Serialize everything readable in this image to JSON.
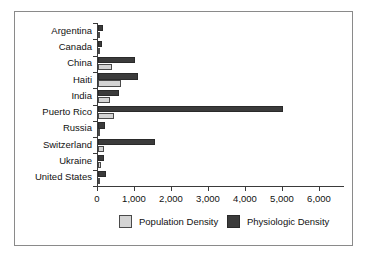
{
  "chart_data": {
    "type": "bar",
    "orientation": "horizontal",
    "title": "",
    "xlabel": "",
    "ylabel": "",
    "categories": [
      "Argentina",
      "Canada",
      "China",
      "Haiti",
      "India",
      "Puerto Rico",
      "Russia",
      "Switzerland",
      "Ukraine",
      "United States"
    ],
    "series": [
      {
        "name": "Population Density",
        "color": "#d4d4d4",
        "values": [
          15,
          10,
          370,
          620,
          330,
          440,
          25,
          175,
          80,
          30
        ]
      },
      {
        "name": "Physiologic Density",
        "color": "#3b3b3b",
        "values": [
          140,
          115,
          1000,
          1080,
          570,
          5000,
          200,
          1550,
          160,
          215
        ]
      }
    ],
    "xlim": [
      0,
      6500
    ],
    "xticks": [
      0,
      1000,
      2000,
      3000,
      4000,
      5000,
      6000
    ],
    "xtick_labels": [
      "0",
      "1,000",
      "2,000",
      "3,000",
      "4,000",
      "5,000",
      "6,000"
    ],
    "grid": false,
    "legend_position": "bottom"
  },
  "legend": {
    "entries": [
      {
        "label": "Population Density",
        "swatch": "population-density-swatch"
      },
      {
        "label": "Physiologic Density",
        "swatch": "physiologic-density-swatch"
      }
    ]
  }
}
